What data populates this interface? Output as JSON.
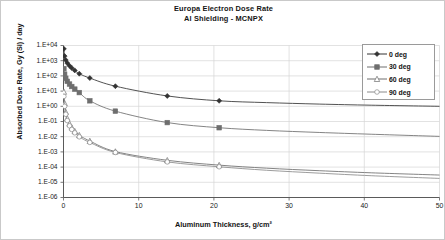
{
  "chart_data": {
    "type": "line",
    "title": "Europa Electron Dose Rate",
    "subtitle": "Al Shielding - MCNPX",
    "xlabel": "Aluminum Thickness, g/cm²",
    "ylabel": "Absorbed Dose Rate, Gy (Si) / day",
    "xlim": [
      0,
      50
    ],
    "ylim": [
      1e-06,
      10000.0
    ],
    "yscale": "log",
    "xscale": "linear",
    "grid": true,
    "legend_position": "top-right",
    "xticks": [
      0,
      10,
      20,
      30,
      40,
      50
    ],
    "xtick_labels": [
      "0",
      "10",
      "20",
      "30",
      "40",
      "50"
    ],
    "yticks": [
      10000,
      1000,
      100,
      10,
      1,
      0.1,
      0.01,
      0.001,
      0.0001,
      1e-05,
      1e-06
    ],
    "ytick_labels": [
      "1.E+04",
      "1.E+03",
      "1.E+02",
      "1.E+01",
      "1.E+00",
      "1.E-01",
      "1.E-02",
      "1.E-03",
      "1.E-04",
      "1.E-05",
      "1.E-06"
    ],
    "series": [
      {
        "name": "0 deg",
        "marker": "filled-diamond",
        "color": "#333333",
        "x": [
          0.05,
          0.15,
          0.3,
          0.5,
          0.8,
          1.1,
          1.5,
          2.1,
          3.5,
          6.9,
          13.8,
          20.7
        ],
        "y": [
          6000,
          2000,
          1100,
          700,
          460,
          330,
          230,
          140,
          72,
          21,
          4.8,
          2.3
        ],
        "line_x": [
          0.05,
          0.15,
          0.3,
          0.5,
          0.8,
          1.1,
          1.5,
          2.1,
          3.5,
          6.9,
          13.8,
          20.7,
          27,
          34,
          41,
          50
        ],
        "line_y": [
          6000,
          2000,
          1100,
          700,
          460,
          330,
          230,
          140,
          72,
          21,
          4.8,
          2.3,
          1.75,
          1.4,
          1.18,
          1.0
        ]
      },
      {
        "name": "30 deg",
        "marker": "filled-square",
        "color": "#6e6e6e",
        "x": [
          0.05,
          0.15,
          0.3,
          0.5,
          0.8,
          1.1,
          1.5,
          2.1,
          3.5,
          6.9,
          13.8,
          20.7
        ],
        "y": [
          300,
          130,
          70,
          44,
          29,
          20,
          13.5,
          8.0,
          2.3,
          0.48,
          0.085,
          0.039
        ],
        "line_x": [
          0.05,
          0.15,
          0.3,
          0.5,
          0.8,
          1.1,
          1.5,
          2.1,
          3.5,
          6.9,
          13.8,
          20.7,
          27,
          34,
          41,
          50
        ],
        "line_y": [
          300,
          130,
          70,
          44,
          29,
          20,
          13.5,
          8.0,
          2.3,
          0.48,
          0.085,
          0.039,
          0.026,
          0.019,
          0.0145,
          0.0105
        ]
      },
      {
        "name": "60 deg",
        "marker": "open-triangle",
        "color": "#6e6e6e",
        "x": [
          0.05,
          0.15,
          0.3,
          0.5,
          0.8,
          1.1,
          1.5,
          2.1,
          3.5,
          6.9,
          13.8,
          20.7
        ],
        "y": [
          9.0,
          1.6,
          0.42,
          0.16,
          0.072,
          0.04,
          0.023,
          0.0125,
          0.0052,
          0.00105,
          0.00028,
          0.000135
        ],
        "line_x": [
          0.05,
          0.15,
          0.3,
          0.5,
          0.8,
          1.1,
          1.5,
          2.1,
          3.5,
          6.9,
          13.8,
          20.7,
          27,
          34,
          41,
          50
        ],
        "line_y": [
          9.0,
          1.6,
          0.42,
          0.16,
          0.072,
          0.04,
          0.023,
          0.0125,
          0.0052,
          0.00105,
          0.00028,
          0.000135,
          8.5e-05,
          5.8e-05,
          4.2e-05,
          3e-05
        ]
      },
      {
        "name": "90 deg",
        "marker": "open-circle",
        "color": "#8a8a8a",
        "x": [
          0.05,
          0.15,
          0.3,
          0.5,
          0.8,
          1.1,
          1.5,
          2.1,
          3.5,
          6.9,
          13.8,
          20.7
        ],
        "y": [
          4.5,
          1.0,
          0.3,
          0.115,
          0.052,
          0.03,
          0.018,
          0.0098,
          0.0042,
          0.00092,
          0.00022,
          0.000105
        ],
        "line_x": [
          0.05,
          0.15,
          0.3,
          0.5,
          0.8,
          1.1,
          1.5,
          2.1,
          3.5,
          6.9,
          13.8,
          20.7,
          27,
          34,
          41,
          50
        ],
        "line_y": [
          4.5,
          1.0,
          0.3,
          0.115,
          0.052,
          0.03,
          0.018,
          0.0098,
          0.0042,
          0.00092,
          0.00022,
          0.000105,
          6.2e-05,
          4e-05,
          2.7e-05,
          1.8e-05
        ]
      }
    ]
  },
  "caption": ""
}
